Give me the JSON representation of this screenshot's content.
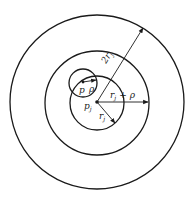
{
  "diagram": {
    "colors": {
      "stroke": "#1a1a1a",
      "background": "#ffffff"
    },
    "center": {
      "x": 97,
      "y": 102
    },
    "circles": [
      {
        "name": "outer-circle",
        "radius_label": "2r_j",
        "r": 87
      },
      {
        "name": "middle-circle",
        "radius_label": "r_j + ρ",
        "r": 52
      },
      {
        "name": "inner-circle",
        "radius_label": "r_j",
        "r": 27
      },
      {
        "name": "small-circle",
        "center_label": "p",
        "radius_label": "ρ",
        "cx": 83,
        "cy": 83,
        "r": 14
      }
    ],
    "labels": {
      "two": "2",
      "r": "r",
      "j": "j",
      "plus": "+",
      "rho": "ρ",
      "p": "p",
      "pj_p": "p",
      "pj_j": "j"
    }
  }
}
